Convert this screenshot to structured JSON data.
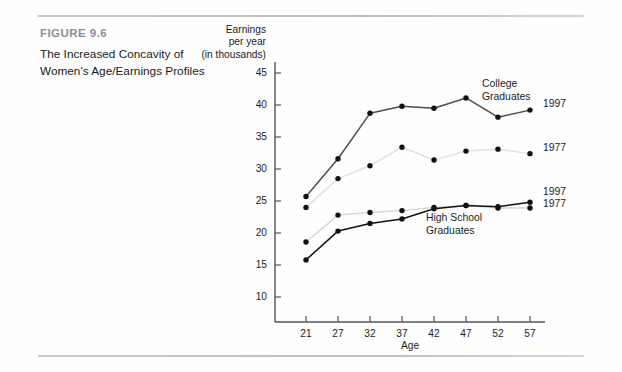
{
  "caption": {
    "figure_number": "FIGURE 9.6",
    "title": "The Increased Concavity of Women's Age/Earnings Profiles"
  },
  "chart_data": {
    "type": "line",
    "title": "",
    "xlabel": "Age",
    "ylabel": "Earnings per year (in thousands)",
    "ylabel_lines": [
      "Earnings",
      "per year",
      "(in thousands)"
    ],
    "x": [
      21,
      27,
      32,
      37,
      42,
      47,
      52,
      57
    ],
    "xtick_labels": [
      "21",
      "27",
      "32",
      "37",
      "42",
      "47",
      "52",
      "57"
    ],
    "ytick_labels": [
      "10",
      "15",
      "20",
      "25",
      "30",
      "35",
      "40",
      "45"
    ],
    "yticks": [
      10,
      15,
      20,
      25,
      30,
      35,
      40,
      45
    ],
    "ylim": [
      7,
      46.5
    ],
    "xlim": [
      18.5,
      60
    ],
    "grid": false,
    "legend_position": "right-inline",
    "series": [
      {
        "name": "College Graduates 1997",
        "short_name": "1997",
        "group": "College Graduates",
        "color": "#4d4d4d",
        "values": [
          25.7,
          31.6,
          38.7,
          39.8,
          39.5,
          41.1,
          38.1,
          39.2
        ]
      },
      {
        "name": "College Graduates 1977",
        "short_name": "1977",
        "group": "College Graduates",
        "color": "#e2e2e2",
        "values": [
          24.0,
          28.5,
          30.5,
          33.4,
          31.4,
          32.8,
          33.1,
          32.4
        ]
      },
      {
        "name": "High School Graduates 1997",
        "short_name": "1997",
        "group": "High School Graduates",
        "color": "#111111",
        "values": [
          15.8,
          20.3,
          21.5,
          22.2,
          23.8,
          24.3,
          24.1,
          24.8
        ]
      },
      {
        "name": "High School Graduates 1977",
        "short_name": "1977",
        "group": "High School Graduates",
        "color": "#d8d8d8",
        "values": [
          18.6,
          22.8,
          23.2,
          23.5,
          24.0,
          24.3,
          23.9,
          23.9
        ]
      }
    ],
    "annotations": [
      {
        "text": "College Graduates",
        "lines": [
          "College",
          "Graduates"
        ]
      },
      {
        "text": "High School Graduates",
        "lines": [
          "High School",
          "Graduates"
        ]
      }
    ]
  },
  "labels": {
    "college_line1": "College",
    "college_line2": "Graduates",
    "hs_line1": "High School",
    "hs_line2": "Graduates",
    "college_1997": "1997",
    "college_1977": "1977",
    "hs_1997": "1997",
    "hs_1977": "1977"
  },
  "colors": {
    "rule": "#c6c6c6",
    "fig_number": "#8a8f96",
    "axis": "#555555",
    "marker": "#111111"
  }
}
